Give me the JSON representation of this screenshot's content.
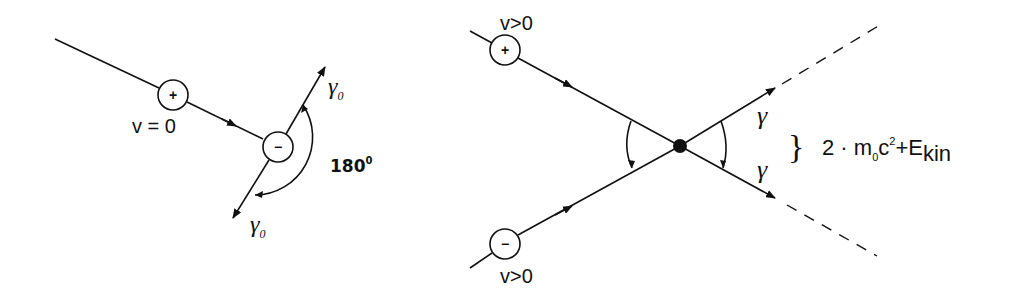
{
  "left_panel": {
    "positron_sign": "+",
    "electron_sign": "−",
    "positron_velocity": "v = 0",
    "photon_upper": "γ",
    "photon_upper_sub": "0",
    "photon_lower": "γ",
    "photon_lower_sub": "0",
    "angle_label": "180",
    "angle_sup": "0"
  },
  "right_panel": {
    "positron_sign": "+",
    "electron_sign": "−",
    "positron_velocity": "v>0",
    "electron_velocity": "v>0",
    "photon_upper": "γ",
    "photon_lower": "γ",
    "brace": "}",
    "energy_prefix": "2 · m",
    "energy_sub": "0",
    "energy_c": "c",
    "energy_sup": "2",
    "energy_plus": "+E",
    "energy_kin": "kin"
  }
}
